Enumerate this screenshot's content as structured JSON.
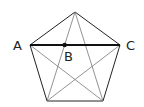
{
  "diagram": {
    "title": "",
    "shape": "regular-pentagon-with-diagonals",
    "vertices": {
      "top": [
        75,
        12
      ],
      "A": [
        30,
        45
      ],
      "C": [
        120,
        45
      ],
      "bottom_left": [
        47,
        101
      ],
      "bottom_right": [
        103,
        101
      ]
    },
    "points": {
      "B": [
        64.6,
        45
      ]
    },
    "labels": {
      "A": "A",
      "B": "B",
      "C": "C"
    },
    "highlighted_segment": "AC",
    "colors": {
      "side": "#222222",
      "diagonal": "#777777",
      "highlight": "#111111",
      "background": "#ffffff"
    }
  }
}
